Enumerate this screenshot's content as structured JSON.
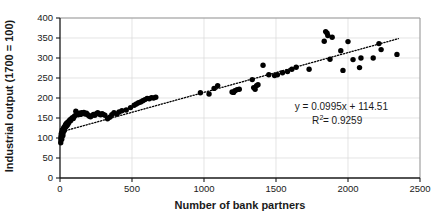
{
  "chart_data": {
    "type": "scatter",
    "title": "",
    "xlabel": "Number of bank partners",
    "ylabel": "Industrial output (1700 = 100)",
    "xlim": [
      0,
      2500
    ],
    "ylim": [
      0,
      400
    ],
    "xticks": [
      0,
      500,
      1000,
      1500,
      2000,
      2500
    ],
    "yticks": [
      0,
      50,
      100,
      150,
      200,
      250,
      300,
      350,
      400
    ],
    "grid": true,
    "legend": null,
    "marker_color": "#000000",
    "trendline": {
      "style": "dotted",
      "color": "#000000",
      "slope": 0.0995,
      "intercept": 114.51,
      "equation": "y = 0.0995x + 114.51",
      "r_squared_label": "R",
      "r_squared_sup": "2",
      "r_squared_value": " = 0.9259"
    },
    "annotations": [
      "y = 0.0995x + 114.51",
      "R2 = 0.9259"
    ],
    "points": [
      [
        5,
        88
      ],
      [
        6,
        95
      ],
      [
        7,
        100
      ],
      [
        8,
        104
      ],
      [
        9,
        108
      ],
      [
        10,
        112
      ],
      [
        12,
        97
      ],
      [
        13,
        103
      ],
      [
        14,
        110
      ],
      [
        15,
        115
      ],
      [
        16,
        120
      ],
      [
        18,
        118
      ],
      [
        20,
        106
      ],
      [
        22,
        113
      ],
      [
        24,
        122
      ],
      [
        26,
        126
      ],
      [
        28,
        124
      ],
      [
        30,
        119
      ],
      [
        33,
        128
      ],
      [
        36,
        131
      ],
      [
        38,
        127
      ],
      [
        40,
        133
      ],
      [
        43,
        136
      ],
      [
        46,
        130
      ],
      [
        50,
        138
      ],
      [
        54,
        134
      ],
      [
        58,
        141
      ],
      [
        62,
        139
      ],
      [
        66,
        143
      ],
      [
        70,
        146
      ],
      [
        75,
        144
      ],
      [
        80,
        148
      ],
      [
        86,
        151
      ],
      [
        92,
        149
      ],
      [
        98,
        153
      ],
      [
        104,
        156
      ],
      [
        110,
        167
      ],
      [
        118,
        160
      ],
      [
        126,
        158
      ],
      [
        134,
        162
      ],
      [
        142,
        159
      ],
      [
        150,
        163
      ],
      [
        158,
        161
      ],
      [
        166,
        164
      ],
      [
        175,
        160
      ],
      [
        184,
        162
      ],
      [
        193,
        158
      ],
      [
        202,
        155
      ],
      [
        212,
        153
      ],
      [
        222,
        156
      ],
      [
        232,
        159
      ],
      [
        242,
        157
      ],
      [
        252,
        161
      ],
      [
        262,
        163
      ],
      [
        272,
        160
      ],
      [
        282,
        158
      ],
      [
        292,
        161
      ],
      [
        300,
        159
      ],
      [
        312,
        157
      ],
      [
        330,
        148
      ],
      [
        345,
        152
      ],
      [
        360,
        158
      ],
      [
        375,
        163
      ],
      [
        395,
        160
      ],
      [
        410,
        165
      ],
      [
        430,
        168
      ],
      [
        460,
        170
      ],
      [
        490,
        176
      ],
      [
        515,
        182
      ],
      [
        530,
        185
      ],
      [
        545,
        188
      ],
      [
        560,
        190
      ],
      [
        575,
        193
      ],
      [
        590,
        196
      ],
      [
        605,
        199
      ],
      [
        620,
        198
      ],
      [
        635,
        201
      ],
      [
        650,
        200
      ],
      [
        665,
        202
      ],
      [
        975,
        213
      ],
      [
        1035,
        210
      ],
      [
        1070,
        224
      ],
      [
        1095,
        231
      ],
      [
        1195,
        215
      ],
      [
        1205,
        214
      ],
      [
        1215,
        218
      ],
      [
        1230,
        221
      ],
      [
        1245,
        222
      ],
      [
        1335,
        246
      ],
      [
        1345,
        226
      ],
      [
        1355,
        222
      ],
      [
        1365,
        231
      ],
      [
        1375,
        233
      ],
      [
        1410,
        282
      ],
      [
        1450,
        258
      ],
      [
        1490,
        256
      ],
      [
        1510,
        258
      ],
      [
        1545,
        263
      ],
      [
        1580,
        266
      ],
      [
        1610,
        272
      ],
      [
        1640,
        277
      ],
      [
        1730,
        272
      ],
      [
        1835,
        342
      ],
      [
        1845,
        366
      ],
      [
        1855,
        362
      ],
      [
        1860,
        356
      ],
      [
        1875,
        297
      ],
      [
        1890,
        352
      ],
      [
        1950,
        318
      ],
      [
        1965,
        269
      ],
      [
        2000,
        341
      ],
      [
        2035,
        296
      ],
      [
        2080,
        276
      ],
      [
        2090,
        300
      ],
      [
        2175,
        300
      ],
      [
        2215,
        336
      ],
      [
        2230,
        321
      ],
      [
        2340,
        309
      ]
    ]
  }
}
